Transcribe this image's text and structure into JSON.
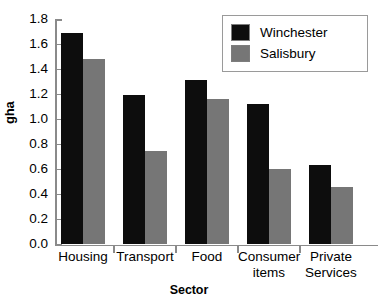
{
  "chart_data": {
    "type": "bar",
    "title": "",
    "xlabel": "Sector",
    "ylabel": "gha",
    "categories": [
      "Housing",
      "Transport",
      "Food",
      "Consumer items",
      "Private Services"
    ],
    "series": [
      {
        "name": "Winchester",
        "color": "#0d0d0d",
        "values": [
          1.69,
          1.19,
          1.31,
          1.12,
          0.63
        ]
      },
      {
        "name": "Salisbury",
        "color": "#767676",
        "values": [
          1.48,
          0.74,
          1.16,
          0.6,
          0.45
        ]
      }
    ],
    "ylim": [
      0.0,
      1.8
    ],
    "ytick_labels": [
      "1.8",
      "1.6",
      "1.4",
      "1.2",
      "1.0",
      "0.8",
      "0.6",
      "0.4",
      "0.2",
      "0.0"
    ],
    "ytick_values": [
      1.8,
      1.6,
      1.4,
      1.2,
      1.0,
      0.8,
      0.6,
      0.4,
      0.2,
      0.0
    ],
    "ytick_step": 0.2,
    "grid": false,
    "legend_position": "top-right",
    "legend_entries": [
      "Winchester",
      "Salisbury"
    ]
  }
}
